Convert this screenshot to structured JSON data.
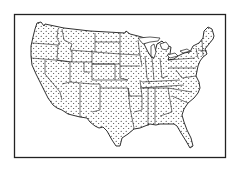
{
  "figure": {
    "style": "black ink line drawing, dotted fill",
    "colors": {
      "background": "#ffffff",
      "ink": "#1a1a1a",
      "frame": "#222222"
    },
    "frame": {
      "x": 14,
      "y": 14,
      "width": 212,
      "height": 144
    }
  }
}
